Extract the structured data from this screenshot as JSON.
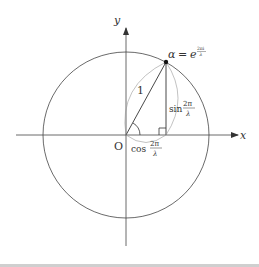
{
  "diagram": {
    "type": "unit-circle-complex-plane",
    "axes": {
      "x_label": "x",
      "y_label": "y",
      "origin_label": "O"
    },
    "point": {
      "label_lhs": "α",
      "label_eq": "=",
      "label_base": "e",
      "label_exp": "2πi",
      "label_exp_den": "λ"
    },
    "radius_label": "1",
    "sin_label": {
      "fn": "sin",
      "num": "2π",
      "den": "λ"
    },
    "cos_label": {
      "fn": "cos",
      "num": "2π",
      "den": "λ"
    },
    "colors": {
      "stroke": "#333333",
      "light_stroke": "#999999",
      "background": "#ffffff",
      "bottom_rule": "#cfcfcf"
    }
  }
}
